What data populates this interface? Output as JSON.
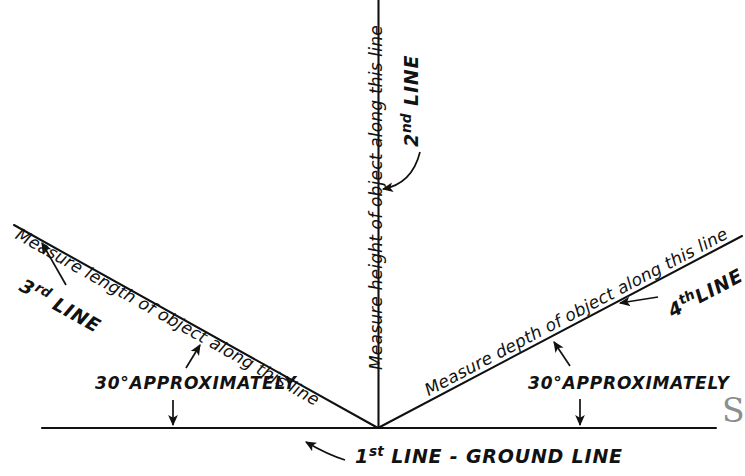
{
  "figure": {
    "background_color": "#ffffff",
    "line_color": "#111111"
  },
  "lines": {
    "ground": {
      "label_number": "1",
      "label_ordinal": "st",
      "label_text": "LINE - GROUND LINE",
      "full_label": "1st LINE - GROUND LINE"
    },
    "vertical": {
      "label_number": "2",
      "label_ordinal": "nd",
      "label_text": "LINE",
      "full_label": "2nd LINE",
      "instruction": "Measure height of object along this line"
    },
    "left_diagonal": {
      "label_number": "3",
      "label_ordinal": "rd",
      "label_text": "LINE",
      "full_label": "3rd LINE",
      "instruction": "Measure length of object along this line",
      "angle_note": "30°APPROXIMATELY"
    },
    "right_diagonal": {
      "label_number": "4",
      "label_ordinal": "th",
      "label_text": "LINE",
      "full_label": "4th LINE",
      "instruction": "Measure depth of object along this line",
      "angle_note": "30°APPROXIMATELY"
    }
  },
  "watermark": {
    "text": "S"
  }
}
